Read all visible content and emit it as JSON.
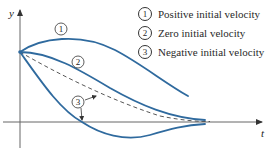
{
  "diagram": {
    "axes": {
      "x_label": "t",
      "y_label": "y"
    },
    "colors": {
      "curve": "#2f6a9e",
      "axis": "#555555",
      "dashed": "#444444",
      "text": "#2a2a2a"
    },
    "curves": [
      {
        "id": "1",
        "label": "1",
        "name": "Positive initial velocity",
        "style": "solid"
      },
      {
        "id": "2",
        "label": "2",
        "name": "Zero initial velocity",
        "style": "solid"
      },
      {
        "id": "3",
        "label": "3",
        "name": "Negative initial velocity",
        "style": "solid"
      },
      {
        "id": "asymptote",
        "name": "Dashed reference curve",
        "style": "dashed"
      }
    ],
    "legend": [
      {
        "num": "1",
        "text": "Positive initial velocity"
      },
      {
        "num": "2",
        "text": "Zero initial velocity"
      },
      {
        "num": "3",
        "text": "Negative initial velocity"
      }
    ]
  }
}
